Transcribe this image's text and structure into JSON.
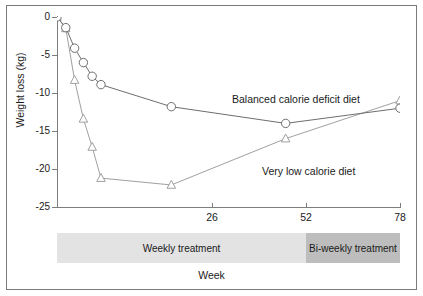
{
  "chart_data": {
    "type": "line",
    "title": "",
    "xlabel": "Week",
    "ylabel": "Weight loss (kg)",
    "xlim": [
      0,
      78
    ],
    "ylim": [
      -25,
      0
    ],
    "grid": false,
    "legend_position": "inline-annotation",
    "x_ticks": [
      26,
      52,
      78
    ],
    "x_tick_labels": [
      "26",
      "52",
      "78"
    ],
    "y_ticks": [
      0,
      -5,
      -10,
      -15,
      -20,
      -25
    ],
    "y_tick_labels": [
      "0",
      "-5",
      "-10",
      "-15",
      "-20",
      "-25"
    ],
    "series": [
      {
        "name": "Balanced calorie deficit diet",
        "marker": "circle",
        "color": "#6e6e6e",
        "x": [
          0,
          2,
          4,
          6,
          8,
          10,
          26,
          52,
          78
        ],
        "values": [
          0,
          -1.4,
          -4.1,
          -6.0,
          -7.8,
          -8.9,
          -11.8,
          -14.0,
          -12.0
        ]
      },
      {
        "name": "Very low calorie diet",
        "marker": "triangle",
        "color": "#a0a0a0",
        "x": [
          0,
          2,
          4,
          6,
          8,
          10,
          26,
          52,
          78
        ],
        "values": [
          0,
          -1.5,
          -8.3,
          -13.4,
          -17.1,
          -21.2,
          -22.1,
          -16.0,
          -11.0
        ]
      }
    ],
    "annotations": [
      {
        "text": "Balanced calorie deficit diet",
        "x": 44,
        "y": -10.2
      },
      {
        "text": "Very low calorie diet",
        "x": 52,
        "y": -19.6
      }
    ]
  },
  "treatment_bands": [
    {
      "label": "Weekly treatment",
      "start_week": 0,
      "end_week": 52,
      "color": "#e3e3e3"
    },
    {
      "label": "Bi-weekly treatment",
      "start_week": 52,
      "end_week": 78,
      "color": "#bdbdbd"
    }
  ],
  "colors": {
    "frame": "#7a7a7a",
    "axis": "#7d7d7d",
    "series_balanced": "#6e6e6e",
    "series_vlcd": "#a0a0a0",
    "band_weekly": "#e3e3e3",
    "band_biweekly": "#bdbdbd",
    "text": "#1a1a1a",
    "background": "#ffffff"
  }
}
